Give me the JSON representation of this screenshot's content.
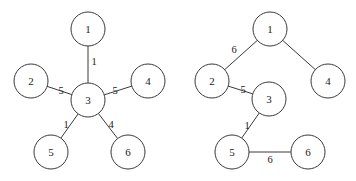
{
  "graphs": [
    {
      "name": "original-graph",
      "radius": 17,
      "nodes": [
        {
          "id": "1",
          "label": "1",
          "x": 88,
          "y": 29
        },
        {
          "id": "2",
          "label": "2",
          "x": 31,
          "y": 81
        },
        {
          "id": "3",
          "label": "3",
          "x": 88,
          "y": 100
        },
        {
          "id": "4",
          "label": "4",
          "x": 148,
          "y": 81
        },
        {
          "id": "5",
          "label": "5",
          "x": 51,
          "y": 152
        },
        {
          "id": "6",
          "label": "6",
          "x": 128,
          "y": 152
        }
      ],
      "edges": [
        {
          "from": "1",
          "to": "3",
          "weight": "1",
          "lx": 94,
          "ly": 61
        },
        {
          "from": "2",
          "to": "3",
          "weight": "5",
          "lx": 61,
          "ly": 90
        },
        {
          "from": "3",
          "to": "4",
          "weight": "5",
          "lx": 115,
          "ly": 90
        },
        {
          "from": "3",
          "to": "5",
          "weight": "1",
          "lx": 66,
          "ly": 124
        },
        {
          "from": "3",
          "to": "6",
          "weight": "4",
          "lx": 111,
          "ly": 124
        }
      ]
    },
    {
      "name": "result-graph",
      "radius": 17,
      "nodes": [
        {
          "id": "1",
          "label": "1",
          "x": 270,
          "y": 29
        },
        {
          "id": "2",
          "label": "2",
          "x": 212,
          "y": 81
        },
        {
          "id": "3",
          "label": "3",
          "x": 269,
          "y": 99
        },
        {
          "id": "4",
          "label": "4",
          "x": 328,
          "y": 81
        },
        {
          "id": "5",
          "label": "5",
          "x": 232,
          "y": 152
        },
        {
          "id": "6",
          "label": "6",
          "x": 308,
          "y": 152
        }
      ],
      "edges": [
        {
          "from": "1",
          "to": "2",
          "weight": "6",
          "lx": 234,
          "ly": 49
        },
        {
          "from": "1",
          "to": "4",
          "weight": "",
          "lx": 0,
          "ly": 0
        },
        {
          "from": "2",
          "to": "3",
          "weight": "5",
          "lx": 243,
          "ly": 89
        },
        {
          "from": "3",
          "to": "5",
          "weight": "1",
          "lx": 247,
          "ly": 125
        },
        {
          "from": "5",
          "to": "6",
          "weight": "6",
          "lx": 270,
          "ly": 159
        }
      ]
    }
  ]
}
